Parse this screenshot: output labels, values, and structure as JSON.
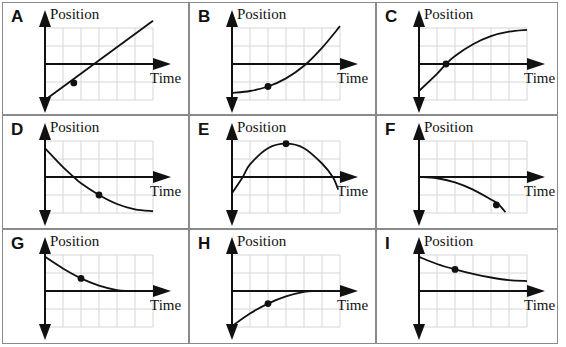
{
  "axis_labels": {
    "y": "Position",
    "x": "Time"
  },
  "colors": {
    "border": "#8a8a8a",
    "grid": "#d6d6d6",
    "ink": "#111111",
    "background": "#ffffff"
  },
  "grid_units": {
    "columns": 6,
    "rows_above": 2,
    "rows_below": 2
  },
  "panels": [
    {
      "letter": "A",
      "description": "straight line, positive slope, starts below origin",
      "curve": [
        [
          0,
          -2
        ],
        [
          6,
          2.4
        ]
      ],
      "curve_type": "line",
      "dot": [
        1.6,
        -1.05
      ]
    },
    {
      "letter": "B",
      "description": "concave up, increasing, starts below axis",
      "curve": [
        [
          0,
          -1.6
        ],
        [
          1,
          -1.5
        ],
        [
          2,
          -1.25
        ],
        [
          3,
          -0.8
        ],
        [
          4,
          -0.1
        ],
        [
          5,
          0.9
        ],
        [
          6,
          2.1
        ]
      ],
      "curve_type": "smooth",
      "dot": [
        2,
        -1.25
      ]
    },
    {
      "letter": "C",
      "description": "concave down, increasing, crosses axis at dot",
      "curve": [
        [
          0,
          -1.5
        ],
        [
          1,
          -0.55
        ],
        [
          1.5,
          0
        ],
        [
          2,
          0.45
        ],
        [
          3,
          1.1
        ],
        [
          4,
          1.55
        ],
        [
          5,
          1.8
        ],
        [
          6,
          1.9
        ]
      ],
      "curve_type": "smooth",
      "dot": [
        1.5,
        0
      ]
    },
    {
      "letter": "D",
      "description": "concave up, decreasing, from above to below axis",
      "curve": [
        [
          0,
          1.6
        ],
        [
          1,
          0.55
        ],
        [
          1.6,
          0
        ],
        [
          2,
          -0.35
        ],
        [
          3,
          -1.0
        ],
        [
          4,
          -1.5
        ],
        [
          5,
          -1.8
        ],
        [
          6,
          -1.9
        ]
      ],
      "curve_type": "smooth",
      "dot": [
        3,
        -1.0
      ]
    },
    {
      "letter": "E",
      "description": "concave down parabola with maximum at dot",
      "curve": [
        [
          0,
          -0.9
        ],
        [
          0.6,
          0
        ],
        [
          1,
          0.7
        ],
        [
          2,
          1.6
        ],
        [
          3,
          1.85
        ],
        [
          4,
          1.6
        ],
        [
          5,
          0.75
        ],
        [
          5.6,
          0
        ],
        [
          5.9,
          -0.7
        ]
      ],
      "curve_type": "smooth",
      "dot": [
        3,
        1.85
      ]
    },
    {
      "letter": "F",
      "description": "starts at origin, concave down, decreasing",
      "curve": [
        [
          0,
          0
        ],
        [
          1,
          -0.07
        ],
        [
          2,
          -0.3
        ],
        [
          3,
          -0.7
        ],
        [
          4,
          -1.25
        ],
        [
          4.4,
          -1.5
        ],
        [
          4.8,
          -1.95
        ]
      ],
      "curve_type": "smooth",
      "dot": [
        4.3,
        -1.55
      ]
    },
    {
      "letter": "G",
      "description": "positive, decreasing, approaches zero",
      "curve": [
        [
          0,
          1.9
        ],
        [
          1,
          1.25
        ],
        [
          2,
          0.7
        ],
        [
          3,
          0.3
        ],
        [
          4,
          0.05
        ],
        [
          4.6,
          0
        ]
      ],
      "curve_type": "smooth",
      "dot": [
        2,
        0.7
      ]
    },
    {
      "letter": "H",
      "description": "negative, increasing, approaches zero",
      "curve": [
        [
          0,
          -1.95
        ],
        [
          1,
          -1.25
        ],
        [
          2,
          -0.7
        ],
        [
          3,
          -0.3
        ],
        [
          4,
          -0.05
        ],
        [
          4.6,
          0
        ]
      ],
      "curve_type": "smooth",
      "dot": [
        2,
        -0.7
      ]
    },
    {
      "letter": "I",
      "description": "positive, decreasing, approaches constant above axis",
      "curve": [
        [
          0,
          1.9
        ],
        [
          1,
          1.5
        ],
        [
          2,
          1.2
        ],
        [
          3,
          0.95
        ],
        [
          4,
          0.75
        ],
        [
          5,
          0.6
        ],
        [
          6,
          0.55
        ]
      ],
      "curve_type": "smooth",
      "dot": [
        2,
        1.2
      ]
    }
  ]
}
